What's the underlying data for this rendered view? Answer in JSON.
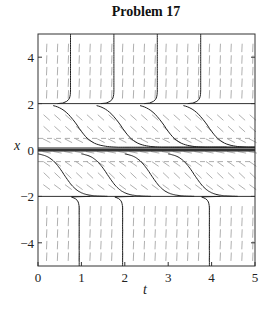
{
  "chart_data": {
    "type": "line",
    "subtype": "direction-field",
    "title": "Problem 17",
    "xlabel": "t",
    "ylabel": "x",
    "xlim": [
      0,
      5
    ],
    "ylim": [
      -5,
      5
    ],
    "xticks": [
      0,
      1,
      2,
      3,
      4,
      5
    ],
    "yticks": [
      -4,
      -2,
      0,
      2,
      4
    ],
    "grid": false,
    "legend": null,
    "equilibria": [
      {
        "x": 2,
        "stability": "unstable"
      },
      {
        "x": 0,
        "stability": "semi-stable"
      },
      {
        "x": -2,
        "stability": "stable"
      }
    ],
    "dashed_lines": [
      0.5,
      -0.5
    ],
    "field_slope_sign": {
      "above_2": "steeply positive",
      "between_0_and_2": "negative",
      "between_neg2_and_0": "negative",
      "below_neg2": "steeply positive"
    },
    "solution_curves": [
      {
        "name": "upper-vertical-1",
        "t_start": 0.75,
        "region": "x>2",
        "behavior": "blows up from x=2"
      },
      {
        "name": "upper-vertical-2",
        "t_start": 1.75,
        "region": "x>2",
        "behavior": "blows up from x=2"
      },
      {
        "name": "upper-vertical-3",
        "t_start": 2.75,
        "region": "x>2",
        "behavior": "blows up from x=2"
      },
      {
        "name": "upper-vertical-4",
        "t_start": 3.75,
        "region": "x>2",
        "behavior": "blows up from x=2"
      },
      {
        "name": "mid-upper-1",
        "t_center": 0.9,
        "region": "0<x<2",
        "behavior": "decreases from 2 toward 0"
      },
      {
        "name": "mid-upper-2",
        "t_center": 1.9,
        "region": "0<x<2",
        "behavior": "decreases from 2 toward 0"
      },
      {
        "name": "mid-upper-3",
        "t_center": 2.9,
        "region": "0<x<2",
        "behavior": "decreases from 2 toward 0"
      },
      {
        "name": "mid-upper-4",
        "t_center": 3.9,
        "region": "0<x<2",
        "behavior": "decreases from 2 toward 0"
      },
      {
        "name": "mid-lower-1",
        "t_center": 0.6,
        "region": "-2<x<0",
        "behavior": "decreases from 0 toward -2"
      },
      {
        "name": "mid-lower-2",
        "t_center": 1.6,
        "region": "-2<x<0",
        "behavior": "decreases from 0 toward -2"
      },
      {
        "name": "mid-lower-3",
        "t_center": 2.6,
        "region": "-2<x<0",
        "behavior": "decreases from 0 toward -2"
      },
      {
        "name": "mid-lower-4",
        "t_center": 3.6,
        "region": "-2<x<0",
        "behavior": "decreases from 0 toward -2"
      },
      {
        "name": "lower-vertical-1",
        "t_end": 0.95,
        "region": "x<-2",
        "behavior": "rises toward -2"
      },
      {
        "name": "lower-vertical-2",
        "t_end": 1.95,
        "region": "x<-2",
        "behavior": "rises toward -2"
      },
      {
        "name": "lower-vertical-3",
        "t_end": 3.95,
        "region": "x<-2",
        "behavior": "rises toward -2"
      }
    ]
  },
  "labels": {
    "title": "Problem 17",
    "xlabel": "t",
    "ylabel": "x",
    "xticks": [
      "0",
      "1",
      "2",
      "3",
      "4",
      "5"
    ],
    "yticks": [
      "4",
      "2",
      "0",
      "−2",
      "−4"
    ]
  }
}
